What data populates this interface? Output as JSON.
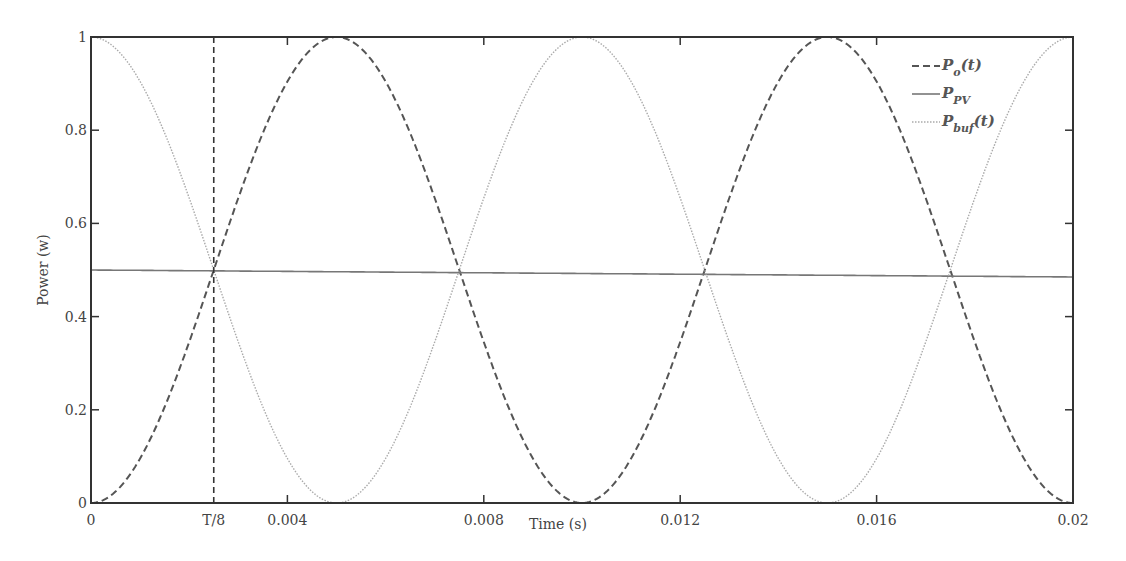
{
  "chart_data": {
    "type": "line",
    "title": "",
    "xlabel": "Time (s)",
    "ylabel": "Power (w)",
    "xlim": [
      0,
      0.02
    ],
    "ylim": [
      0,
      1
    ],
    "grid": false,
    "legend_position": "upper right",
    "x_ticks": [
      {
        "value": 0,
        "label": "0"
      },
      {
        "value": 0.0025,
        "label": "T/8"
      },
      {
        "value": 0.004,
        "label": "0.004"
      },
      {
        "value": 0.008,
        "label": "0.008"
      },
      {
        "value": 0.012,
        "label": "0.012"
      },
      {
        "value": 0.016,
        "label": "0.016"
      },
      {
        "value": 0.02,
        "label": "0.02"
      }
    ],
    "y_ticks": [
      {
        "value": 0,
        "label": "0"
      },
      {
        "value": 0.2,
        "label": "0.2"
      },
      {
        "value": 0.4,
        "label": "0.4"
      },
      {
        "value": 0.6,
        "label": "0.6"
      },
      {
        "value": 0.8,
        "label": "0.8"
      },
      {
        "value": 1,
        "label": "1"
      }
    ],
    "annotations": [
      {
        "type": "vertical-dashed-line",
        "x": 0.0025,
        "label": "T/8"
      }
    ],
    "series": [
      {
        "name": "Po(t)",
        "legend_main": "P",
        "legend_sub": "o",
        "legend_suffix": "(t)",
        "style": "dashed",
        "color": "#555555",
        "formula": "sin^2(2*pi*100*t/2) peak at 0.005, 0.015",
        "x": [
          0,
          0.0025,
          0.005,
          0.0075,
          0.01,
          0.0125,
          0.015,
          0.0175,
          0.02
        ],
        "values": [
          0,
          0.5,
          1,
          0.5,
          0,
          0.5,
          1,
          0.5,
          0
        ]
      },
      {
        "name": "PPV",
        "legend_main": "P",
        "legend_sub": "PV",
        "legend_suffix": "",
        "style": "solid",
        "color": "#777777",
        "x": [
          0,
          0.02
        ],
        "values": [
          0.5,
          0.5
        ]
      },
      {
        "name": "Pbuf(t)",
        "legend_main": "P",
        "legend_sub": "buf",
        "legend_suffix": "(t)",
        "style": "dotted",
        "color": "#aaaaaa",
        "x": [
          0,
          0.0025,
          0.005,
          0.0075,
          0.01,
          0.0125,
          0.015,
          0.0175,
          0.02
        ],
        "values": [
          1,
          0.5,
          0,
          0.5,
          1,
          0.5,
          0,
          0.5,
          1
        ]
      }
    ]
  },
  "layout": {
    "plot_left": 91,
    "plot_right": 1073,
    "plot_top": 37,
    "plot_bottom": 503
  }
}
